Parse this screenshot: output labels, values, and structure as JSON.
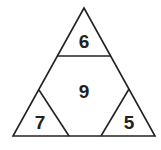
{
  "diagram": {
    "type": "triangle-puzzle",
    "line_color": "#222222",
    "background": "#ffffff",
    "regions": {
      "top": {
        "label": "6"
      },
      "center": {
        "label": "9"
      },
      "bottom_left": {
        "label": "7"
      },
      "bottom_right": {
        "label": "5"
      }
    }
  }
}
